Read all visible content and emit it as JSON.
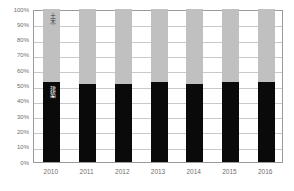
{
  "chart_data": {
    "type": "bar",
    "stacked": true,
    "normalized": "100%",
    "title": "",
    "xlabel": "",
    "ylabel": "",
    "categories": [
      "2010",
      "2011",
      "2012",
      "2013",
      "2014",
      "2015",
      "2016"
    ],
    "series": [
      {
        "name": "建築",
        "color": "#0a0a0a",
        "values": [
          52,
          51,
          51,
          52,
          51,
          52.5,
          52.5
        ]
      },
      {
        "name": "土木",
        "color": "#c0c0c0",
        "values": [
          48,
          49,
          49,
          48,
          49,
          47.5,
          47.5
        ]
      }
    ],
    "ylim": [
      0,
      100
    ],
    "ytick_labels": [
      "100%",
      "90%",
      "80%",
      "70%",
      "60%",
      "50%",
      "40%",
      "30%",
      "20%",
      "10%",
      "0%"
    ],
    "ytick_values": [
      100,
      90,
      80,
      70,
      60,
      50,
      40,
      30,
      20,
      10,
      0
    ],
    "grid": true,
    "legend_position": "in-bar-annotations",
    "annotations": [
      {
        "text": "土木",
        "series": "土木",
        "category": "2010"
      },
      {
        "text": "建築",
        "series": "建築",
        "category": "2010"
      }
    ]
  },
  "colors": {
    "upper_segment": "#c0c0c0",
    "lower_segment": "#0a0a0a",
    "gridline": "#c9c9c9",
    "axis": "#9a9a9a",
    "tick_text": "#6e6e6e",
    "background": "#ffffff"
  }
}
